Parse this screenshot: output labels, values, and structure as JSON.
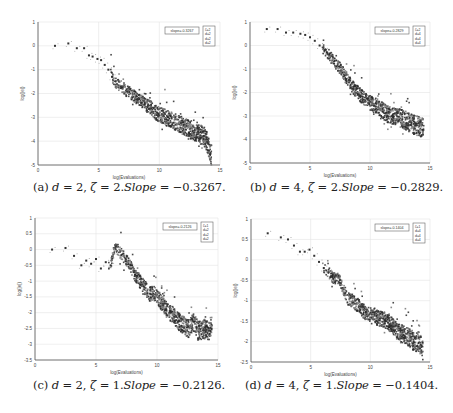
{
  "figure": {
    "panels": [
      {
        "id": "a",
        "caption": {
          "label": "(a)",
          "d": "2",
          "zeta": "2",
          "slope_word": "Slope",
          "slope_value": "−0.3267."
        },
        "legend_slope": "slope=-0.3267",
        "legend_entries": [
          "ζ=2",
          "d=2",
          "d=2",
          "d=2"
        ]
      },
      {
        "id": "b",
        "caption": {
          "label": "(b)",
          "d": "4",
          "zeta": "2",
          "slope_word": "Slope",
          "slope_value": "−0.2829."
        },
        "legend_slope": "slope=-0.2829",
        "legend_entries": [
          "ζ=2",
          "d=4",
          "d=4",
          "d=4"
        ]
      },
      {
        "id": "c",
        "caption": {
          "label": "(c)",
          "d": "2",
          "zeta": "1",
          "slope_word": "Slope",
          "slope_value": "−0.2126."
        },
        "legend_slope": "slope=-0.2126",
        "legend_entries": [
          "ζ=1",
          "d=2",
          "d=2",
          "d=2"
        ]
      },
      {
        "id": "d",
        "caption": {
          "label": "(d)",
          "d": "4",
          "zeta": "1",
          "slope_word": "Slope",
          "slope_value": "−0.1404."
        },
        "legend_slope": "slope=-0.1404",
        "legend_entries": [
          "ζ=1",
          "d=4",
          "d=4",
          "d=4"
        ]
      }
    ]
  },
  "chart_data": [
    {
      "type": "scatter",
      "title": "(a) d = 2, ζ = 2. Slope = -0.3267.",
      "xlabel": "log(Evaluations)",
      "ylabel": "log(|e|)",
      "xlim": [
        0,
        15
      ],
      "ylim": [
        -5,
        1
      ],
      "xticks": [
        0,
        5,
        10,
        15
      ],
      "yticks": [
        -5,
        -4,
        -3,
        -2,
        -1,
        0,
        1
      ],
      "grid": true,
      "legend_position": "upper right",
      "legend": [
        "slope=-0.3267"
      ],
      "series": [
        {
          "name": "log|e| vs log(evaluations)",
          "x": [
            1.4,
            2.5,
            3.2,
            3.8,
            4.2,
            4.5,
            4.9,
            5.2,
            5.5,
            5.8,
            6.1,
            6.5,
            6.9,
            7.3,
            7.7,
            8.1,
            8.5,
            8.9,
            9.3,
            9.7,
            10.1,
            10.5,
            10.9,
            11.3,
            11.7,
            12.1,
            12.5,
            12.9,
            13.3,
            13.7,
            14.0,
            14.3
          ],
          "y": [
            0.0,
            0.1,
            -0.1,
            -0.1,
            -0.4,
            -0.45,
            -0.55,
            -0.6,
            -0.8,
            -1.0,
            -1.3,
            -1.6,
            -1.7,
            -1.9,
            -2.0,
            -2.2,
            -2.3,
            -2.5,
            -2.6,
            -2.8,
            -2.9,
            -3.0,
            -3.1,
            -3.2,
            -3.3,
            -3.4,
            -3.5,
            -3.6,
            -3.7,
            -3.8,
            -4.1,
            -4.6
          ]
        }
      ],
      "slope": -0.3267
    },
    {
      "type": "scatter",
      "title": "(b) d = 4, ζ = 2. Slope = -0.2829.",
      "xlabel": "log(Evaluations)",
      "ylabel": "log(|e|)",
      "xlim": [
        0,
        15
      ],
      "ylim": [
        -5,
        1
      ],
      "xticks": [
        0,
        5,
        10,
        15
      ],
      "yticks": [
        -5,
        -4,
        -3,
        -2,
        -1,
        0,
        1
      ],
      "grid": true,
      "legend_position": "upper right",
      "legend": [
        "slope=-0.2829"
      ],
      "series": [
        {
          "name": "log|e| vs log(evaluations)",
          "x": [
            1.4,
            2.3,
            3.0,
            3.6,
            4.2,
            4.6,
            5.0,
            5.4,
            5.8,
            6.2,
            6.6,
            7.0,
            7.4,
            7.8,
            8.2,
            8.6,
            9.0,
            9.4,
            9.8,
            10.2,
            10.6,
            11.0,
            11.4,
            11.8,
            12.2,
            12.6,
            13.0,
            13.4,
            13.8,
            14.2,
            14.5
          ],
          "y": [
            0.7,
            0.7,
            0.55,
            0.55,
            0.5,
            0.45,
            0.35,
            0.2,
            0.0,
            -0.2,
            -0.4,
            -0.7,
            -0.9,
            -1.2,
            -1.5,
            -1.8,
            -2.0,
            -2.2,
            -2.4,
            -2.5,
            -2.6,
            -2.75,
            -2.9,
            -3.0,
            -3.05,
            -3.1,
            -3.2,
            -3.3,
            -3.4,
            -3.45,
            -3.5
          ]
        }
      ],
      "slope": -0.2829
    },
    {
      "type": "scatter",
      "title": "(c) d = 2, ζ = 1. Slope = -0.2126.",
      "xlabel": "log(Evaluations)",
      "ylabel": "log(|e|)",
      "xlim": [
        0,
        15
      ],
      "ylim": [
        -3.5,
        1
      ],
      "xticks": [
        0,
        5,
        10,
        15
      ],
      "yticks": [
        -3.5,
        -3,
        -2.5,
        -2,
        -1.5,
        -1,
        -0.5,
        0,
        0.5,
        1
      ],
      "grid": true,
      "legend_position": "upper right",
      "legend": [
        "slope=-0.2126"
      ],
      "series": [
        {
          "name": "log|e| vs log(evaluations)",
          "x": [
            1.4,
            2.5,
            3.2,
            3.8,
            4.2,
            4.6,
            5.0,
            5.4,
            5.8,
            6.2,
            6.6,
            7.0,
            7.4,
            7.8,
            8.2,
            8.6,
            9.0,
            9.4,
            9.8,
            10.2,
            10.6,
            11.0,
            11.4,
            11.8,
            12.2,
            12.6,
            13.0,
            13.4,
            13.8,
            14.2,
            14.5
          ],
          "y": [
            0.0,
            0.05,
            -0.2,
            -0.5,
            -0.35,
            -0.45,
            -0.3,
            -0.6,
            -0.4,
            -0.5,
            0.1,
            -0.1,
            -0.3,
            -0.5,
            -0.8,
            -1.0,
            -1.2,
            -1.4,
            -1.4,
            -1.6,
            -1.8,
            -2.0,
            -2.1,
            -2.3,
            -2.4,
            -2.5,
            -2.3,
            -2.6,
            -2.5,
            -2.6,
            -2.4
          ]
        }
      ],
      "slope": -0.2126
    },
    {
      "type": "scatter",
      "title": "(d) d = 4, ζ = 1. Slope = -0.1404.",
      "xlabel": "log(Evaluations)",
      "ylabel": "log(|e|)",
      "xlim": [
        0,
        15
      ],
      "ylim": [
        -2.5,
        1
      ],
      "xticks": [
        0,
        5,
        10,
        15
      ],
      "yticks": [
        -2.5,
        -2,
        -1.5,
        -1,
        -0.5,
        0,
        0.5,
        1
      ],
      "grid": true,
      "legend_position": "upper right",
      "legend": [
        "slope=-0.1404"
      ],
      "series": [
        {
          "name": "log|e| vs log(evaluations)",
          "x": [
            1.4,
            2.5,
            3.1,
            3.6,
            4.1,
            4.5,
            4.9,
            5.3,
            5.7,
            6.1,
            6.5,
            6.9,
            7.3,
            7.7,
            8.1,
            8.5,
            8.9,
            9.3,
            9.7,
            10.1,
            10.5,
            10.9,
            11.3,
            11.7,
            12.1,
            12.5,
            12.9,
            13.3,
            13.7,
            14.1,
            14.4
          ],
          "y": [
            0.65,
            0.55,
            0.5,
            0.35,
            0.2,
            0.2,
            0.25,
            0.1,
            -0.05,
            -0.2,
            -0.3,
            -0.45,
            -0.45,
            -0.7,
            -0.95,
            -1.0,
            -1.1,
            -1.2,
            -1.35,
            -1.3,
            -1.4,
            -1.45,
            -1.5,
            -1.55,
            -1.7,
            -1.8,
            -1.85,
            -1.9,
            -2.0,
            -2.0,
            -2.2
          ]
        }
      ],
      "slope": -0.1404
    }
  ]
}
